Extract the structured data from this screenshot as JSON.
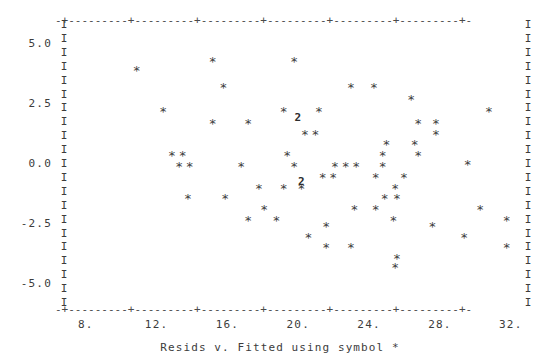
{
  "chart_data": {
    "type": "scatter",
    "title": "",
    "caption": "Resids v. Fitted using symbol *",
    "xlabel": "",
    "ylabel": "",
    "symbol": "*",
    "overplot_symbol": "2",
    "xlim": [
      7.0,
      33.2
    ],
    "ylim": [
      -5.8,
      5.8
    ],
    "grid": false,
    "legend": false,
    "y_ticks": [
      "5.0",
      "2.5",
      "0.0",
      "-2.5",
      "-5.0"
    ],
    "y_tick_values": [
      5.0,
      2.5,
      0.0,
      -2.5,
      -5.0
    ],
    "x_ticks": [
      "8.",
      "12.",
      "16.",
      "20.",
      "24.",
      "28.",
      "32."
    ],
    "x_tick_values": [
      8,
      12,
      16,
      20,
      24,
      28,
      32
    ],
    "axis_border_glyph": "I",
    "axis_rule_glyph": "-",
    "axis_tick_glyph": "+",
    "points": [
      {
        "x": 15.4,
        "y": 4.4,
        "symbol": "*"
      },
      {
        "x": 20.0,
        "y": 4.4,
        "symbol": "*"
      },
      {
        "x": 23.2,
        "y": 3.3,
        "symbol": "*"
      },
      {
        "x": 24.5,
        "y": 3.3,
        "symbol": "*"
      },
      {
        "x": 26.6,
        "y": 2.8,
        "symbol": "*"
      },
      {
        "x": 12.6,
        "y": 2.3,
        "symbol": "*"
      },
      {
        "x": 19.4,
        "y": 2.3,
        "symbol": "*"
      },
      {
        "x": 21.4,
        "y": 2.3,
        "symbol": "*"
      },
      {
        "x": 31.0,
        "y": 2.3,
        "symbol": "*"
      },
      {
        "x": 15.4,
        "y": 1.8,
        "symbol": "*"
      },
      {
        "x": 17.4,
        "y": 1.8,
        "symbol": "*"
      },
      {
        "x": 27.0,
        "y": 1.8,
        "symbol": "*"
      },
      {
        "x": 28.0,
        "y": 1.8,
        "symbol": "*"
      },
      {
        "x": 20.6,
        "y": 1.35,
        "symbol": "*"
      },
      {
        "x": 21.2,
        "y": 1.35,
        "symbol": "*"
      },
      {
        "x": 28.0,
        "y": 1.35,
        "symbol": "*"
      },
      {
        "x": 20.2,
        "y": 1.9,
        "symbol": "2"
      },
      {
        "x": 25.2,
        "y": 0.9,
        "symbol": "*"
      },
      {
        "x": 26.8,
        "y": 0.9,
        "symbol": "*"
      },
      {
        "x": 13.1,
        "y": 0.45,
        "symbol": "*"
      },
      {
        "x": 13.7,
        "y": 0.45,
        "symbol": "*"
      },
      {
        "x": 25.0,
        "y": 0.45,
        "symbol": "*"
      },
      {
        "x": 27.0,
        "y": 0.45,
        "symbol": "*"
      },
      {
        "x": 19.6,
        "y": 0.45,
        "symbol": "*"
      },
      {
        "x": 13.5,
        "y": 0.0,
        "symbol": "*"
      },
      {
        "x": 14.1,
        "y": 0.0,
        "symbol": "*"
      },
      {
        "x": 17.0,
        "y": 0.0,
        "symbol": "*"
      },
      {
        "x": 20.0,
        "y": 0.0,
        "symbol": "*"
      },
      {
        "x": 22.3,
        "y": 0.0,
        "symbol": "*"
      },
      {
        "x": 22.9,
        "y": 0.0,
        "symbol": "*"
      },
      {
        "x": 23.5,
        "y": 0.0,
        "symbol": "*"
      },
      {
        "x": 25.0,
        "y": 0.0,
        "symbol": "*"
      },
      {
        "x": 29.8,
        "y": 0.1,
        "symbol": "*"
      },
      {
        "x": 21.6,
        "y": -0.45,
        "symbol": "*"
      },
      {
        "x": 22.2,
        "y": -0.45,
        "symbol": "*"
      },
      {
        "x": 24.6,
        "y": -0.45,
        "symbol": "*"
      },
      {
        "x": 26.2,
        "y": -0.45,
        "symbol": "*"
      },
      {
        "x": 18.0,
        "y": -0.9,
        "symbol": "*"
      },
      {
        "x": 19.4,
        "y": -0.9,
        "symbol": "*"
      },
      {
        "x": 20.4,
        "y": -0.9,
        "symbol": "*"
      },
      {
        "x": 25.7,
        "y": -0.9,
        "symbol": "*"
      },
      {
        "x": 14.0,
        "y": -1.35,
        "symbol": "*"
      },
      {
        "x": 16.1,
        "y": -1.35,
        "symbol": "*"
      },
      {
        "x": 25.1,
        "y": -1.35,
        "symbol": "*"
      },
      {
        "x": 25.8,
        "y": -1.35,
        "symbol": "*"
      },
      {
        "x": 20.4,
        "y": -0.75,
        "symbol": "2"
      },
      {
        "x": 18.3,
        "y": -1.8,
        "symbol": "*"
      },
      {
        "x": 23.4,
        "y": -1.8,
        "symbol": "*"
      },
      {
        "x": 24.6,
        "y": -1.8,
        "symbol": "*"
      },
      {
        "x": 30.5,
        "y": -1.8,
        "symbol": "*"
      },
      {
        "x": 17.4,
        "y": -2.25,
        "symbol": "*"
      },
      {
        "x": 19.0,
        "y": -2.25,
        "symbol": "*"
      },
      {
        "x": 25.6,
        "y": -2.25,
        "symbol": "*"
      },
      {
        "x": 32.0,
        "y": -2.25,
        "symbol": "*"
      },
      {
        "x": 21.8,
        "y": -2.5,
        "symbol": "*"
      },
      {
        "x": 27.8,
        "y": -2.5,
        "symbol": "*"
      },
      {
        "x": 20.8,
        "y": -2.95,
        "symbol": "*"
      },
      {
        "x": 29.6,
        "y": -2.95,
        "symbol": "*"
      },
      {
        "x": 21.8,
        "y": -3.4,
        "symbol": "*"
      },
      {
        "x": 23.2,
        "y": -3.4,
        "symbol": "*"
      },
      {
        "x": 32.0,
        "y": -3.4,
        "symbol": "*"
      },
      {
        "x": 25.8,
        "y": -3.85,
        "symbol": "*"
      },
      {
        "x": 25.7,
        "y": -4.2,
        "symbol": "*"
      },
      {
        "x": 16.0,
        "y": 3.3,
        "symbol": "*"
      },
      {
        "x": 11.1,
        "y": 4.0,
        "symbol": "*"
      }
    ]
  },
  "layout": {
    "plot_left_px": 64,
    "plot_right_px": 528,
    "plot_top_px": 24,
    "plot_bottom_px": 302,
    "top_rule": "-+---------+---------+---------+---------+---------+---------+-",
    "bottom_rule": "-+---------+---------+---------+---------+---------+---------+-"
  }
}
